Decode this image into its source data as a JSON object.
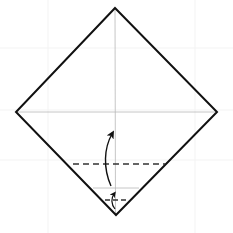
{
  "diagram": {
    "type": "origami-fold-step",
    "colors": {
      "background": "#ffffff",
      "paper_edge": "#111111",
      "crease": "#b8b8b8",
      "fold_line": "#333333",
      "arrow": "#111111",
      "grid": "#f2f2f2"
    },
    "elements": {
      "paper": "diamond-square",
      "creases": [
        "vertical-center-crease",
        "horizontal-center-crease",
        "small-bottom-crease"
      ],
      "fold_lines": [
        "valley-fold-large",
        "valley-fold-small"
      ],
      "arrows": [
        "fold-up-arrow-large",
        "fold-up-arrow-small"
      ]
    }
  }
}
